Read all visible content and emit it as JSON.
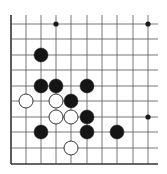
{
  "board": {
    "description": "Go board partial diagram (lower-left corner region)",
    "columns_x": [
      11,
      26,
      41,
      56,
      71,
      87,
      102,
      117,
      133,
      148
    ],
    "rows_y": [
      24,
      39,
      55,
      70,
      86,
      101,
      117,
      132,
      148
    ],
    "top_open_y": 15,
    "right_open_x": 158,
    "left_edge_x": 11,
    "bottom_edge_y": 164,
    "line_color": "#555555",
    "edge_color": "#333333",
    "star_points": [
      {
        "col": 3,
        "row": 0
      },
      {
        "col": 9,
        "row": 0
      },
      {
        "col": 9,
        "row": 6
      }
    ],
    "stones": [
      {
        "color": "black",
        "col": 2,
        "row": 2
      },
      {
        "color": "black",
        "col": 2,
        "row": 4
      },
      {
        "color": "black",
        "col": 3,
        "row": 4
      },
      {
        "color": "black",
        "col": 5,
        "row": 4
      },
      {
        "color": "white",
        "col": 1,
        "row": 5
      },
      {
        "color": "white",
        "col": 3,
        "row": 5
      },
      {
        "color": "black",
        "col": 4,
        "row": 5
      },
      {
        "color": "white",
        "col": 3,
        "row": 6
      },
      {
        "color": "white",
        "col": 4,
        "row": 6
      },
      {
        "color": "black",
        "col": 5,
        "row": 6
      },
      {
        "color": "black",
        "col": 2,
        "row": 7
      },
      {
        "color": "black",
        "col": 5,
        "row": 7
      },
      {
        "color": "black",
        "col": 7,
        "row": 7
      },
      {
        "color": "white",
        "col": 4,
        "row": 8
      }
    ]
  }
}
